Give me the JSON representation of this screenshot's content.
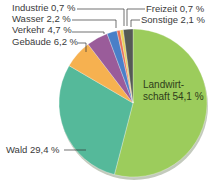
{
  "chart_data": {
    "type": "pie",
    "title": "",
    "start_angle_deg": 0,
    "direction": "clockwise",
    "slices": [
      {
        "label": "Landwirtschaft",
        "value": 54.1,
        "display": "Landwirt-\nschaft 54,1 %",
        "color": "#9ccc5c"
      },
      {
        "label": "Wald",
        "value": 29.4,
        "display": "Wald 29,4 %",
        "color": "#55b99a"
      },
      {
        "label": "Gebäude",
        "value": 6.2,
        "display": "Gebäude 6,2 %",
        "color": "#f6b150"
      },
      {
        "label": "Verkehr",
        "value": 4.7,
        "display": "Verkehr 4,7 %",
        "color": "#9a5c9a"
      },
      {
        "label": "Wasser",
        "value": 2.2,
        "display": "Wasser 2,2 %",
        "color": "#4a7fc8"
      },
      {
        "label": "Industrie",
        "value": 0.7,
        "display": "Industrie 0,7 %",
        "color": "#e8705a"
      },
      {
        "label": "Freizeit",
        "value": 0.7,
        "display": "Freizeit 0,7 %",
        "color": "#e8d25a"
      },
      {
        "label": "Sonstige",
        "value": 2.1,
        "display": "Sonstige 2,1 %",
        "color": "#555a55"
      }
    ],
    "legend": "none (callout labels)"
  },
  "labels": {
    "industrie": "Industrie 0,7 %",
    "wasser": "Wasser 2,2 %",
    "verkehr": "Verkehr 4,7 %",
    "gebaeude": "Gebäude 6,2 %",
    "wald": "Wald 29,4 %",
    "freizeit": "Freizeit 0,7 %",
    "sonstige": "Sonstige 2,1 %",
    "landwirtschaft_line1": "Landwirt-",
    "landwirtschaft_line2": "schaft 54,1 %"
  }
}
